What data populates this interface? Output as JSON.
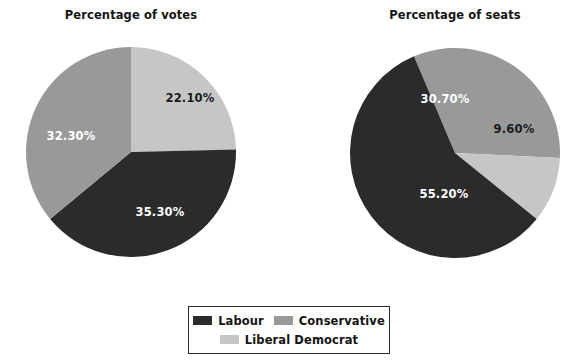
{
  "figure": {
    "background_color": "#ffffff",
    "width": 577,
    "height": 363
  },
  "palette": {
    "labour": "#2b2b2b",
    "conservative": "#999999",
    "liberal_democrat": "#c6c6c6",
    "label_on_dark": "#ffffff",
    "label_on_light": "#1a1a1a",
    "legend_border": "#2b2b2b"
  },
  "titles": {
    "votes": "Percentage of votes",
    "seats": "Percentage of seats"
  },
  "legend": {
    "rows": [
      [
        {
          "label": "Labour",
          "color": "#2b2b2b"
        },
        {
          "label": "Conservative",
          "color": "#999999"
        }
      ],
      [
        {
          "label": "Liberal Democrat",
          "color": "#c6c6c6"
        }
      ]
    ]
  },
  "labels": {
    "votes": {
      "liberal_democrat": "22.10%",
      "labour": "35.30%",
      "conservative": "32.30%"
    },
    "seats": {
      "conservative": "30.70%",
      "liberal_democrat": "9.60%",
      "labour": "55.20%"
    }
  },
  "chart_data": [
    {
      "type": "pie",
      "title": "Percentage of votes",
      "labels": [
        "Liberal Democrat",
        "Labour",
        "Conservative"
      ],
      "values": [
        22.1,
        35.3,
        32.3
      ],
      "value_labels": [
        "22.10%",
        "35.30%",
        "32.30%"
      ],
      "colors": [
        "#c6c6c6",
        "#2b2b2b",
        "#999999"
      ],
      "start_angle_deg": 0,
      "direction": "clockwise",
      "normalized": true,
      "total_of_values": 89.7,
      "legend_position": "bottom",
      "grid": false
    },
    {
      "type": "pie",
      "title": "Percentage of seats",
      "labels": [
        "Conservative",
        "Liberal Democrat",
        "Labour"
      ],
      "values": [
        30.7,
        9.6,
        55.2
      ],
      "value_labels": [
        "30.70%",
        "9.60%",
        "55.20%"
      ],
      "colors": [
        "#999999",
        "#c6c6c6",
        "#2b2b2b"
      ],
      "start_angle_deg": -23,
      "direction": "clockwise",
      "normalized": true,
      "total_of_values": 95.5,
      "legend_position": "bottom",
      "grid": false
    }
  ]
}
